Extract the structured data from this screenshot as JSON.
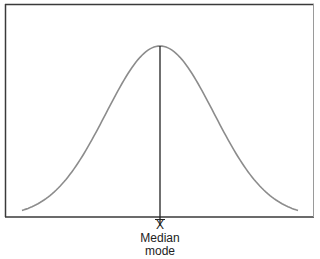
{
  "diagram": {
    "title": "",
    "type": "normal-distribution",
    "labels": {
      "mean": "X",
      "median": "Median",
      "mode": "mode"
    },
    "colors": {
      "frame": "#3a3a3a",
      "curve": "#8c8c8c",
      "center_line": "#222222",
      "text": "#222222"
    }
  },
  "chart_data": {
    "type": "line",
    "title": "",
    "xlabel": "",
    "ylabel": "",
    "series": [
      {
        "name": "normal-curve",
        "x": [
          -3,
          -2.5,
          -2,
          -1.5,
          -1,
          -0.5,
          0,
          0.5,
          1,
          1.5,
          2,
          2.5,
          3
        ],
        "values": [
          0.004,
          0.018,
          0.054,
          0.13,
          0.242,
          0.352,
          0.399,
          0.352,
          0.242,
          0.13,
          0.054,
          0.018,
          0.004
        ]
      }
    ],
    "annotations": [
      {
        "x": 0,
        "text": "X̄ / Median / mode",
        "type": "vertical-line"
      }
    ],
    "grid": false,
    "legend": null
  }
}
